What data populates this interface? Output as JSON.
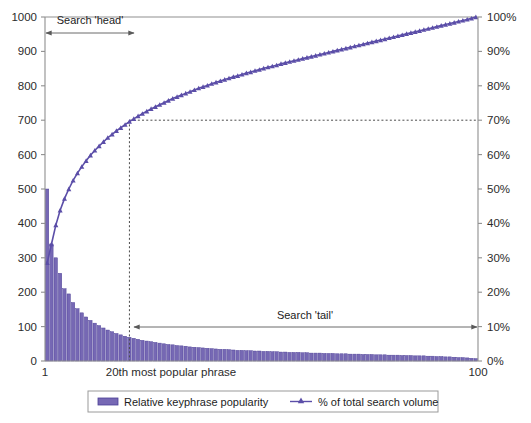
{
  "chart_data": {
    "type": "bar",
    "title": "",
    "subtitle": "",
    "xlabel": "",
    "ylabel": "",
    "y2label": "",
    "grid": false,
    "legend_position": "bottom",
    "x": [
      1,
      2,
      3,
      4,
      5,
      6,
      7,
      8,
      9,
      10,
      11,
      12,
      13,
      14,
      15,
      16,
      17,
      18,
      19,
      20,
      21,
      22,
      23,
      24,
      25,
      26,
      27,
      28,
      29,
      30,
      31,
      32,
      33,
      34,
      35,
      36,
      37,
      38,
      39,
      40,
      41,
      42,
      43,
      44,
      45,
      46,
      47,
      48,
      49,
      50,
      51,
      52,
      53,
      54,
      55,
      56,
      57,
      58,
      59,
      60,
      61,
      62,
      63,
      64,
      65,
      66,
      67,
      68,
      69,
      70,
      71,
      72,
      73,
      74,
      75,
      76,
      77,
      78,
      79,
      80,
      81,
      82,
      83,
      84,
      85,
      86,
      87,
      88,
      89,
      90,
      91,
      92,
      93,
      94,
      95,
      96,
      97,
      98,
      99,
      100
    ],
    "xlim": [
      1,
      100
    ],
    "ylim": [
      0,
      1000
    ],
    "y2lim": [
      0,
      100
    ],
    "x_ticks": [
      "1",
      "100"
    ],
    "x_tick_values": [
      1,
      100
    ],
    "y_ticks": [
      "0",
      "100",
      "200",
      "300",
      "400",
      "500",
      "600",
      "700",
      "800",
      "900",
      "1000"
    ],
    "y_tick_values": [
      0,
      100,
      200,
      300,
      400,
      500,
      600,
      700,
      800,
      900,
      1000
    ],
    "y2_ticks": [
      "0%",
      "10%",
      "20%",
      "30%",
      "40%",
      "50%",
      "60%",
      "70%",
      "80%",
      "90%",
      "100%"
    ],
    "y2_tick_values": [
      0,
      10,
      20,
      30,
      40,
      50,
      60,
      70,
      80,
      90,
      100
    ],
    "series": [
      {
        "name": "Relative keyphrase popularity",
        "type": "bar",
        "axis": "left",
        "color": "#7668b4",
        "edge_color": "#4c3f96",
        "values": [
          500,
          340,
          300,
          255,
          210,
          195,
          170,
          152,
          140,
          128,
          118,
          110,
          103,
          96,
          90,
          85,
          80,
          76,
          72,
          69,
          66,
          63,
          60,
          58,
          56,
          54,
          52,
          50,
          48,
          47,
          45,
          44,
          43,
          41,
          40,
          39,
          38,
          37,
          36,
          35,
          34,
          34,
          33,
          32,
          31,
          31,
          30,
          30,
          29,
          29,
          28,
          28,
          27,
          27,
          26,
          26,
          25,
          25,
          25,
          24,
          24,
          23,
          23,
          23,
          22,
          22,
          22,
          21,
          21,
          21,
          20,
          20,
          20,
          19,
          19,
          19,
          18,
          18,
          18,
          17,
          17,
          17,
          16,
          16,
          16,
          15,
          15,
          15,
          14,
          14,
          13,
          13,
          12,
          12,
          11,
          10,
          10,
          9,
          8,
          7
        ]
      },
      {
        "name": "% of total search volume",
        "type": "line",
        "axis": "right",
        "color": "#5b4ea8",
        "marker": "triangle",
        "values": [
          28.5,
          34.0,
          39.5,
          43.8,
          47.2,
          50.0,
          52.5,
          54.6,
          56.5,
          58.2,
          59.8,
          61.2,
          62.5,
          63.7,
          64.9,
          65.9,
          66.9,
          67.8,
          68.7,
          69.6,
          70.4,
          71.2,
          71.9,
          72.6,
          73.3,
          73.9,
          74.5,
          75.1,
          75.7,
          76.3,
          76.8,
          77.3,
          77.8,
          78.3,
          78.8,
          79.3,
          79.7,
          80.1,
          80.6,
          81.0,
          81.4,
          81.8,
          82.2,
          82.6,
          82.9,
          83.3,
          83.7,
          84.0,
          84.4,
          84.7,
          85.1,
          85.4,
          85.7,
          86.0,
          86.4,
          86.7,
          87.0,
          87.3,
          87.6,
          87.9,
          88.2,
          88.5,
          88.8,
          89.1,
          89.4,
          89.7,
          90.0,
          90.3,
          90.6,
          90.9,
          91.2,
          91.5,
          91.8,
          92.1,
          92.4,
          92.7,
          93.0,
          93.3,
          93.6,
          93.9,
          94.2,
          94.5,
          94.8,
          95.1,
          95.4,
          95.7,
          96.0,
          96.3,
          96.6,
          96.9,
          97.2,
          97.5,
          97.8,
          98.1,
          98.4,
          98.7,
          99.0,
          99.3,
          99.6,
          100.0
        ]
      }
    ],
    "annotations": [
      {
        "name": "search-head",
        "label": "Search 'head'",
        "x_start": 1,
        "x_end": 21,
        "y_percent": 94,
        "style": "double-arrow"
      },
      {
        "name": "search-tail",
        "label": "Search 'tail'",
        "x_start": 21,
        "x_end": 100,
        "y_percent": 10,
        "style": "double-arrow"
      },
      {
        "name": "threshold-marker",
        "label": "20th most popular phrase",
        "x": 20,
        "y_percent": 70,
        "style": "dashed-crosshair"
      }
    ]
  },
  "axes": {
    "left_ticks": [
      "1000",
      "900",
      "800",
      "700",
      "600",
      "500",
      "400",
      "300",
      "200",
      "100",
      "0"
    ],
    "right_ticks": [
      "100%",
      "90%",
      "80%",
      "70%",
      "60%",
      "50%",
      "40%",
      "30%",
      "20%",
      "10%",
      "0%"
    ],
    "x_tick_left": "1",
    "x_tick_right": "100"
  },
  "annotations": {
    "head_label": "Search 'head'",
    "tail_label": "Search 'tail'",
    "threshold_label": "20th most popular phrase"
  },
  "legend": {
    "items": [
      {
        "label": "Relative keyphrase popularity",
        "marker": "bar-swatch",
        "color": "#7668b4"
      },
      {
        "label": "% of total search volume",
        "marker": "triangle-line",
        "color": "#5b4ea8"
      }
    ]
  },
  "colors": {
    "bar_fill": "#7668b4",
    "bar_edge": "#4c3f96",
    "line": "#5b4ea8",
    "axis": "#8f8f8f",
    "dash": "#4a4a4a",
    "background": "#ffffff"
  }
}
